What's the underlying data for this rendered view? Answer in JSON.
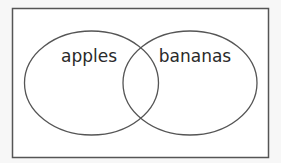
{
  "diagram": {
    "type": "venn",
    "sets": [
      {
        "id": "left",
        "label": "apples"
      },
      {
        "id": "right",
        "label": "bananas"
      }
    ],
    "colors": {
      "background": "#f7f7f7",
      "box_fill": "#ffffff",
      "stroke": "#555555",
      "text": "#2a2a2a"
    }
  }
}
